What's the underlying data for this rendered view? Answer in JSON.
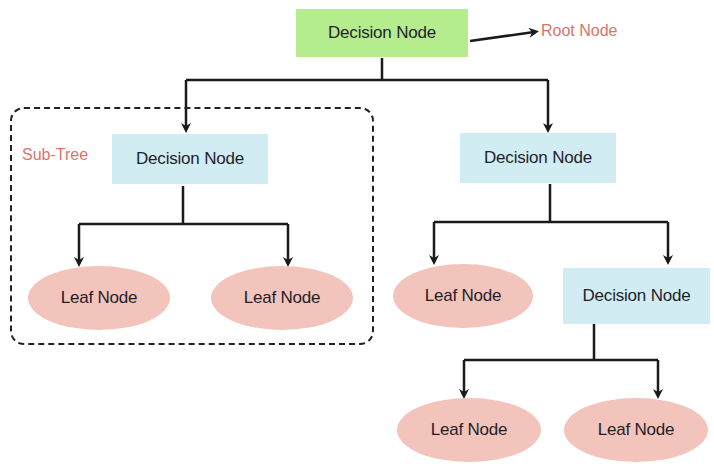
{
  "diagram": {
    "type": "decision-tree",
    "root": {
      "label": "Decision Node",
      "annotation": "Root Node",
      "color": "#b5ec8e"
    },
    "subtree_label": "Sub-Tree",
    "left": {
      "label": "Decision Node",
      "color": "#d2ecf4",
      "children": [
        {
          "label": "Leaf Node",
          "color": "#f3c4bb"
        },
        {
          "label": "Leaf Node",
          "color": "#f3c4bb"
        }
      ]
    },
    "right": {
      "label": "Decision Node",
      "color": "#d2ecf4",
      "children": [
        {
          "label": "Leaf Node",
          "color": "#f3c4bb"
        },
        {
          "label": "Decision Node",
          "color": "#d2ecf4",
          "children": [
            {
              "label": "Leaf Node",
              "color": "#f3c4bb"
            },
            {
              "label": "Leaf Node",
              "color": "#f3c4bb"
            }
          ]
        }
      ]
    },
    "annotation_color": "#d4766b"
  }
}
